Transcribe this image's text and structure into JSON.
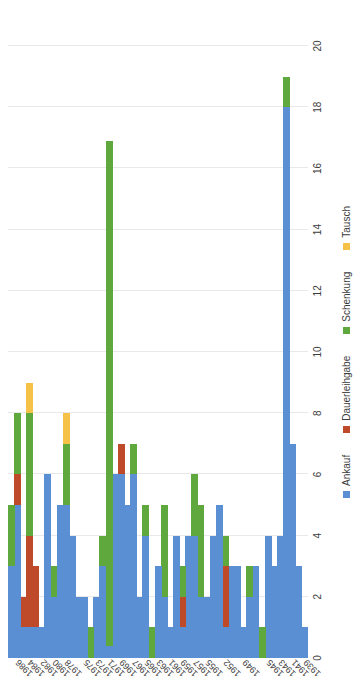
{
  "chart_data": {
    "type": "bar",
    "orientation": "horizontal-stacked",
    "title": "",
    "subtitle": "",
    "xlabel": "",
    "ylabel": "",
    "xlim": [
      0,
      20
    ],
    "xticks": [
      0,
      2,
      4,
      6,
      8,
      10,
      12,
      14,
      16,
      18,
      20
    ],
    "grid": true,
    "legend_position": "bottom",
    "legend": [
      {
        "name": "Ankauf",
        "color": "#5b8fd4"
      },
      {
        "name": "Dauerleihgabe",
        "color": "#bf4a2a"
      },
      {
        "name": "Schenkung",
        "color": "#5fa83d"
      },
      {
        "name": "Tausch",
        "color": "#f5c247"
      }
    ],
    "categories": [
      "1939",
      "1940",
      "1941",
      "1942",
      "1943",
      "1944",
      "1945",
      "1946",
      "1947",
      "1948",
      "1949",
      "1950",
      "1951",
      "1952",
      "1953",
      "1954",
      "1955",
      "1956",
      "1957",
      "1958",
      "1959",
      "1960",
      "1961",
      "1962",
      "1963",
      "1964",
      "1965",
      "1966",
      "1967",
      "1968",
      "1969",
      "1970",
      "1971",
      "1972",
      "1973",
      "1974",
      "1975",
      "1976",
      "1977",
      "1978",
      "1979",
      "1980",
      "1981",
      "1982",
      "1983",
      "1984",
      "1985",
      "1986",
      "1987"
    ],
    "tick_categories": [
      "1939",
      "1941",
      "1943",
      "1945",
      "1949",
      "1952",
      "1955",
      "1957",
      "1959",
      "1961",
      "1963",
      "1965",
      "1967",
      "1969",
      "1971",
      "1973",
      "1975",
      "1978",
      "1980",
      "1982",
      "1984",
      "1986"
    ],
    "series": [
      {
        "name": "Ankauf",
        "color": "#5b8fd4",
        "values": [
          1,
          3,
          7,
          18,
          4,
          3,
          4,
          0,
          3,
          2,
          1,
          3,
          3,
          1,
          5,
          4,
          2,
          2,
          4,
          4,
          1,
          4,
          1,
          2,
          3,
          0,
          4,
          2,
          6,
          5,
          6,
          6,
          0.4,
          3,
          2,
          0,
          2,
          2,
          4,
          5,
          5,
          2,
          6,
          1,
          1,
          1,
          1,
          5,
          3
        ]
      },
      {
        "name": "Dauerleihgabe",
        "color": "#bf4a2a",
        "values": [
          0,
          0,
          0,
          0,
          0,
          0,
          0,
          0,
          0,
          0,
          0,
          0,
          0,
          2,
          0,
          0,
          0,
          0,
          0,
          0,
          1,
          0,
          0,
          0,
          0,
          0,
          0,
          0,
          0,
          0,
          1,
          0,
          0,
          0,
          0,
          0,
          0,
          0,
          0,
          0,
          0,
          0,
          0,
          0,
          2,
          3,
          1,
          1,
          0
        ]
      },
      {
        "name": "Schenkung",
        "color": "#5fa83d",
        "values": [
          0,
          0,
          0,
          1,
          0,
          0,
          0,
          1,
          0,
          1,
          0,
          0,
          0,
          1,
          0,
          0,
          0,
          3,
          2,
          0,
          1,
          0,
          0,
          3,
          0,
          1,
          1,
          0,
          1,
          0,
          0,
          0,
          16.5,
          1,
          0,
          1,
          0,
          0,
          0,
          2,
          0,
          1,
          0,
          0,
          0,
          4,
          0,
          2,
          2
        ]
      },
      {
        "name": "Tausch",
        "color": "#f5c247",
        "values": [
          0,
          0,
          0,
          0,
          0,
          0,
          0,
          0,
          0,
          0,
          0,
          0,
          0,
          0,
          0,
          0,
          0,
          0,
          0,
          0,
          0,
          0,
          0,
          0,
          0,
          0,
          0,
          0,
          0,
          0,
          0,
          0,
          0,
          0,
          0,
          0,
          0,
          0,
          0,
          1,
          0,
          0,
          0,
          0,
          0,
          1,
          0,
          0,
          0
        ]
      }
    ]
  }
}
